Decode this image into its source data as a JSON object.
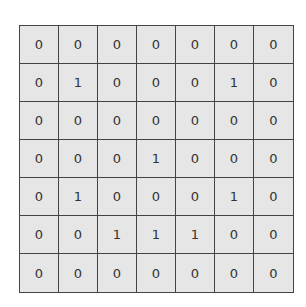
{
  "grid": {
    "rows": 7,
    "cols": 7,
    "cells": [
      [
        "0",
        "0",
        "0",
        "0",
        "0",
        "0",
        "0"
      ],
      [
        "0",
        "1",
        "0",
        "0",
        "0",
        "1",
        "0"
      ],
      [
        "0",
        "0",
        "0",
        "0",
        "0",
        "0",
        "0"
      ],
      [
        "0",
        "0",
        "0",
        "1",
        "0",
        "0",
        "0"
      ],
      [
        "0",
        "1",
        "0",
        "0",
        "0",
        "1",
        "0"
      ],
      [
        "0",
        "0",
        "1",
        "1",
        "1",
        "0",
        "0"
      ],
      [
        "0",
        "0",
        "0",
        "0",
        "0",
        "0",
        "0"
      ]
    ]
  },
  "colors": {
    "cell_background": "#e6e6e6",
    "grid_line": "#444444",
    "text": "#333333"
  }
}
